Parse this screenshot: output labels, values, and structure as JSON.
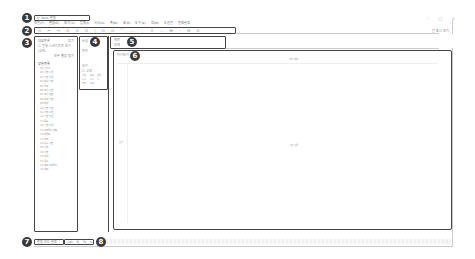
{
  "window": {
    "title": "D· Sens· 편집",
    "controls": [
      "–",
      "□",
      "×"
    ],
    "right_link": "간 표시 보기"
  },
  "menubar": {
    "items": [
      "파일(F)",
      "편집(E)",
      "보기(V)",
      "입력(I)",
      "서식(O)",
      "쪽(W)",
      "표(B)",
      "도구(K)",
      "창(W)",
      "도움말",
      "환경설정"
    ]
  },
  "toolbar": {
    "buttons": [
      "⊙",
      "←",
      "→",
      "⊡",
      "⊡",
      "⊡",
      "|",
      "⊡",
      "⊡",
      "⌒",
      "…",
      "⋮",
      "↕",
      "…",
      "⊞",
      "–",
      "⊟",
      "⊘"
    ]
  },
  "callouts": [
    "1",
    "2",
    "3",
    "4",
    "5",
    "6",
    "7",
    "8"
  ],
  "left_panel": {
    "header_left": "대화목록",
    "header_right": "찾기",
    "checkbox_label": "전체 스크리트로 보기 (상태)",
    "sub_actions": "모두 펼침 접기",
    "section_label": "장면목록",
    "items": [
      "01  인트로",
      "02  장면 1번",
      "03  장면 2번",
      "04  회상 장면",
      "05  효과",
      "06  추가 장면",
      "07  추가 편집",
      "08  효과 장면",
      "09  회상",
      "10  장면 3번",
      "11  장면 4번",
      "12  장면 5번",
      "13  종료",
      "14  장면 6번",
      "15  스크립트 편집",
      "16  마무리",
      "17  효과",
      "18  특수 장면",
      "19  장면",
      "20  장면",
      "21  효과",
      "22  종료",
      "23  예비 스크립트",
      "24  예비"
    ]
  },
  "mid_panel": {
    "title": "속성",
    "line1": "위치",
    "line2": "크기",
    "checkbox": "고정",
    "grid": [
      "가로",
      "세로",
      "위치",
      "0.0",
      "0.0",
      "0",
      "높이",
      "너비",
      ""
    ]
  },
  "prop_panel": {
    "line1": "제목",
    "line2": "부제"
  },
  "canvas": {
    "label": "미리보기",
    "top_text": "작업 영역",
    "center_text": "장면 내용",
    "left_text": "눈금"
  },
  "statusbar": {
    "text": "편집 모드 완료",
    "zoom_label": "100",
    "zoom_buttons": [
      "🔍",
      "🔍",
      "⊡"
    ]
  }
}
